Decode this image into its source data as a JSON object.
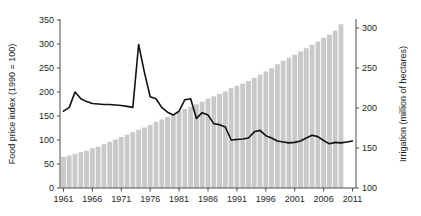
{
  "chart_data": {
    "type": "bar",
    "title": "",
    "xlabel": "",
    "ylabel": "Food price index (1990 = 100)",
    "y2label": "Irrigation (million of hectares)",
    "grid": false,
    "legend": "none",
    "x": [
      1961,
      1962,
      1963,
      1964,
      1965,
      1966,
      1967,
      1968,
      1969,
      1970,
      1971,
      1972,
      1973,
      1974,
      1975,
      1976,
      1977,
      1978,
      1979,
      1980,
      1981,
      1982,
      1983,
      1984,
      1985,
      1986,
      1987,
      1988,
      1989,
      1990,
      1991,
      1992,
      1993,
      1994,
      1995,
      1996,
      1997,
      1998,
      1999,
      2000,
      2001,
      2002,
      2003,
      2004,
      2005,
      2006,
      2007,
      2008,
      2009,
      2010,
      2011
    ],
    "xticks": [
      1961,
      1966,
      1971,
      1976,
      1981,
      1986,
      1991,
      1996,
      2001,
      2006,
      2011
    ],
    "xlim": [
      1960.4,
      2011.6
    ],
    "yticks": [
      0,
      50,
      100,
      150,
      200,
      250,
      300,
      350
    ],
    "ylim": [
      0,
      350
    ],
    "y2ticks": [
      100,
      150,
      200,
      250,
      300
    ],
    "y2lim": [
      100,
      310
    ],
    "series": [
      {
        "name": "Irrigation (million of hectares)",
        "type": "bar",
        "axis": "right",
        "color": "#c9c9c9",
        "x": [
          1961,
          1962,
          1963,
          1964,
          1965,
          1966,
          1967,
          1968,
          1969,
          1970,
          1971,
          1972,
          1973,
          1974,
          1975,
          1976,
          1977,
          1978,
          1979,
          1980,
          1981,
          1982,
          1983,
          1984,
          1985,
          1986,
          1987,
          1988,
          1989,
          1990,
          1991,
          1992,
          1993,
          1994,
          1995,
          1996,
          1997,
          1998,
          1999,
          2000,
          2001,
          2002,
          2003,
          2004,
          2005,
          2006,
          2007,
          2008,
          2009
        ],
        "values": [
          139,
          141,
          143,
          145,
          147,
          150,
          152,
          155,
          158,
          161,
          164,
          167,
          170,
          173,
          176,
          179,
          183,
          186,
          189,
          192,
          196,
          199,
          202,
          205,
          208,
          212,
          215,
          218,
          221,
          225,
          228,
          231,
          234,
          238,
          242,
          246,
          250,
          255,
          259,
          263,
          267,
          271,
          275,
          279,
          283,
          288,
          292,
          297,
          305
        ]
      },
      {
        "name": "Food price index (1990 = 100)",
        "type": "line",
        "axis": "left",
        "color": "#111111",
        "x": [
          1961,
          1962,
          1963,
          1964,
          1965,
          1966,
          1967,
          1968,
          1969,
          1970,
          1971,
          1972,
          1973,
          1974,
          1975,
          1976,
          1977,
          1978,
          1979,
          1980,
          1981,
          1982,
          1983,
          1984,
          1985,
          1986,
          1987,
          1988,
          1989,
          1990,
          1991,
          1992,
          1993,
          1994,
          1995,
          1996,
          1997,
          1998,
          1999,
          2000,
          2001,
          2002,
          2003,
          2004,
          2005,
          2006,
          2007,
          2008,
          2009,
          2010,
          2011
        ],
        "values": [
          160,
          168,
          200,
          186,
          180,
          176,
          175,
          174,
          174,
          173,
          172,
          170,
          168,
          299,
          241,
          190,
          186,
          168,
          158,
          152,
          160,
          184,
          186,
          145,
          157,
          152,
          134,
          132,
          127,
          100,
          101,
          102,
          104,
          117,
          120,
          109,
          104,
          98,
          96,
          94,
          95,
          98,
          104,
          110,
          107,
          99,
          92,
          95,
          94,
          96,
          98
        ]
      }
    ],
    "annotations": []
  },
  "axes": {
    "left": {
      "title": "Food price index (1990 = 100)",
      "tick_labels": [
        "0",
        "50",
        "100",
        "150",
        "200",
        "250",
        "300",
        "350"
      ]
    },
    "right": {
      "title": "Irrigation (million of hectares)",
      "tick_labels": [
        "100",
        "150",
        "200",
        "250",
        "300"
      ]
    },
    "bottom": {
      "tick_labels": [
        "1961",
        "1966",
        "1971",
        "1976",
        "1981",
        "1986",
        "1991",
        "1996",
        "2001",
        "2006",
        "2011"
      ]
    }
  }
}
